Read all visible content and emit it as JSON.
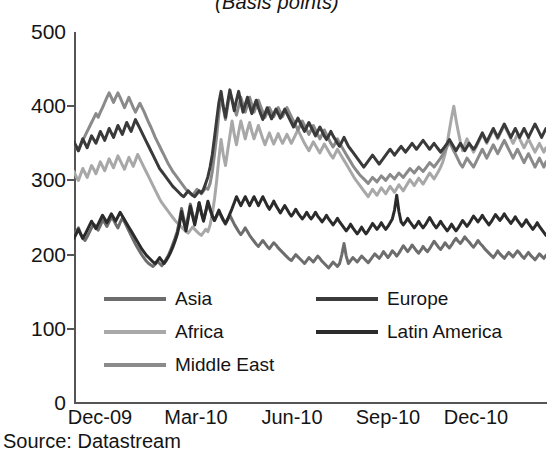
{
  "chart_data": {
    "type": "line",
    "title": "(Basis points)",
    "xlabel": "",
    "ylabel": "",
    "ylim": [
      0,
      500
    ],
    "yticks": [
      0,
      100,
      200,
      300,
      400,
      500
    ],
    "xticks": [
      "Dec-09",
      "Mar-10",
      "Jun-10",
      "Sep-10",
      "Dec-10"
    ],
    "grid": false,
    "legend_position": "inside-lower-left",
    "source": "Source: Datastream",
    "series": [
      {
        "name": "Asia",
        "color": "#6d6d6d",
        "values": [
          227,
          231,
          236,
          228,
          222,
          219,
          224,
          230,
          236,
          241,
          238,
          233,
          239,
          246,
          243,
          238,
          244,
          250,
          247,
          241,
          236,
          243,
          249,
          244,
          238,
          232,
          226,
          220,
          214,
          209,
          204,
          199,
          195,
          191,
          188,
          186,
          184,
          187,
          191,
          188,
          185,
          189,
          194,
          199,
          206,
          214,
          222,
          231,
          245,
          262,
          248,
          236,
          252,
          268,
          255,
          243,
          256,
          270,
          258,
          247,
          258,
          268,
          260,
          252,
          246,
          252,
          258,
          252,
          246,
          241,
          247,
          253,
          247,
          241,
          236,
          231,
          227,
          231,
          236,
          231,
          226,
          222,
          218,
          214,
          211,
          215,
          219,
          215,
          211,
          208,
          212,
          216,
          213,
          209,
          206,
          203,
          200,
          197,
          194,
          192,
          196,
          200,
          197,
          194,
          191,
          188,
          192,
          196,
          193,
          190,
          194,
          198,
          195,
          191,
          188,
          185,
          182,
          186,
          190,
          187,
          184,
          188,
          200,
          215,
          198,
          188,
          192,
          196,
          193,
          190,
          194,
          198,
          195,
          192,
          189,
          193,
          197,
          201,
          198,
          195,
          199,
          204,
          200,
          196,
          200,
          205,
          202,
          198,
          202,
          207,
          212,
          208,
          204,
          208,
          213,
          209,
          205,
          202,
          206,
          211,
          207,
          204,
          208,
          213,
          218,
          214,
          210,
          207,
          211,
          216,
          212,
          209,
          213,
          218,
          222,
          218,
          215,
          219,
          224,
          220,
          217,
          213,
          210,
          214,
          219,
          215,
          212,
          208,
          205,
          202,
          199,
          196,
          200,
          205,
          201,
          198,
          195,
          199,
          203,
          200,
          197,
          201,
          205,
          202,
          198,
          195,
          199,
          203,
          199,
          196,
          193,
          197,
          201,
          198,
          195,
          199
        ]
      },
      {
        "name": "Africa",
        "color": "#a8a8a8",
        "values": [
          312,
          305,
          300,
          308,
          316,
          310,
          304,
          312,
          320,
          315,
          309,
          317,
          325,
          319,
          313,
          321,
          329,
          323,
          317,
          325,
          333,
          327,
          321,
          315,
          323,
          331,
          325,
          319,
          327,
          335,
          329,
          323,
          317,
          311,
          305,
          299,
          293,
          287,
          281,
          275,
          270,
          266,
          262,
          258,
          254,
          250,
          246,
          243,
          240,
          237,
          234,
          231,
          229,
          233,
          237,
          234,
          231,
          228,
          226,
          230,
          234,
          231,
          240,
          255,
          275,
          300,
          330,
          355,
          335,
          320,
          340,
          360,
          380,
          362,
          348,
          365,
          380,
          368,
          356,
          368,
          378,
          366,
          356,
          365,
          374,
          365,
          356,
          348,
          356,
          364,
          356,
          349,
          356,
          363,
          356,
          350,
          356,
          362,
          356,
          350,
          356,
          362,
          368,
          362,
          356,
          350,
          345,
          340,
          346,
          352,
          347,
          342,
          337,
          343,
          349,
          344,
          339,
          334,
          330,
          336,
          342,
          337,
          332,
          327,
          322,
          317,
          312,
          307,
          302,
          298,
          294,
          290,
          286,
          282,
          278,
          283,
          288,
          284,
          280,
          285,
          290,
          286,
          282,
          287,
          292,
          288,
          284,
          289,
          294,
          290,
          286,
          291,
          296,
          301,
          297,
          293,
          298,
          303,
          299,
          295,
          300,
          305,
          310,
          306,
          302,
          307,
          312,
          318,
          325,
          335,
          350,
          368,
          385,
          400,
          382,
          366,
          352,
          340,
          348,
          356,
          350,
          344,
          338,
          344,
          350,
          356,
          362,
          356,
          350,
          356,
          362,
          368,
          362,
          356,
          362,
          368,
          374,
          368,
          362,
          356,
          350,
          356,
          362,
          356,
          350,
          344,
          350,
          356,
          350,
          344,
          338,
          344,
          350,
          344,
          338,
          344
        ]
      },
      {
        "name": "Middle East",
        "color": "#8a8a8a",
        "values": [
          350,
          345,
          340,
          347,
          354,
          360,
          366,
          372,
          378,
          384,
          390,
          385,
          392,
          398,
          405,
          412,
          418,
          412,
          405,
          412,
          418,
          412,
          405,
          398,
          405,
          412,
          405,
          398,
          392,
          398,
          404,
          398,
          392,
          385,
          378,
          372,
          365,
          358,
          352,
          346,
          340,
          334,
          328,
          322,
          317,
          312,
          308,
          304,
          300,
          296,
          292,
          288,
          285,
          282,
          280,
          284,
          288,
          285,
          282,
          286,
          290,
          288,
          296,
          312,
          335,
          360,
          390,
          415,
          398,
          382,
          400,
          418,
          410,
          398,
          388,
          400,
          412,
          402,
          392,
          402,
          412,
          402,
          392,
          400,
          408,
          400,
          392,
          385,
          392,
          398,
          392,
          386,
          392,
          398,
          392,
          386,
          392,
          398,
          392,
          386,
          380,
          374,
          368,
          374,
          380,
          374,
          368,
          362,
          368,
          374,
          368,
          362,
          356,
          362,
          368,
          362,
          356,
          350,
          345,
          350,
          356,
          350,
          345,
          340,
          335,
          330,
          325,
          320,
          316,
          312,
          308,
          305,
          302,
          299,
          296,
          300,
          304,
          301,
          298,
          302,
          306,
          303,
          300,
          304,
          308,
          305,
          302,
          306,
          310,
          307,
          304,
          308,
          312,
          316,
          313,
          310,
          314,
          318,
          315,
          312,
          316,
          320,
          324,
          321,
          318,
          322,
          326,
          330,
          335,
          340,
          346,
          352,
          346,
          340,
          334,
          328,
          322,
          318,
          324,
          330,
          326,
          322,
          318,
          324,
          330,
          336,
          342,
          336,
          330,
          336,
          342,
          348,
          342,
          336,
          342,
          348,
          354,
          348,
          342,
          336,
          330,
          336,
          342,
          336,
          330,
          324,
          330,
          336,
          330,
          324,
          318,
          324,
          330,
          324,
          318,
          325
        ]
      },
      {
        "name": "Europe",
        "color": "#3a3a3a",
        "values": [
          352,
          346,
          340,
          348,
          356,
          350,
          344,
          352,
          360,
          355,
          350,
          358,
          366,
          360,
          354,
          362,
          370,
          364,
          358,
          366,
          374,
          368,
          362,
          370,
          378,
          372,
          366,
          374,
          382,
          376,
          370,
          364,
          358,
          352,
          346,
          340,
          334,
          328,
          322,
          316,
          312,
          308,
          304,
          300,
          296,
          292,
          289,
          286,
          283,
          280,
          278,
          282,
          286,
          283,
          280,
          278,
          282,
          286,
          283,
          288,
          296,
          305,
          318,
          335,
          358,
          382,
          405,
          420,
          400,
          385,
          405,
          422,
          408,
          394,
          408,
          420,
          405,
          392,
          402,
          412,
          400,
          390,
          400,
          408,
          398,
          390,
          382,
          390,
          398,
          390,
          383,
          390,
          396,
          390,
          384,
          390,
          396,
          390,
          384,
          378,
          372,
          378,
          384,
          378,
          372,
          366,
          372,
          378,
          372,
          366,
          360,
          366,
          372,
          366,
          360,
          355,
          360,
          366,
          360,
          355,
          350,
          346,
          352,
          358,
          352,
          346,
          342,
          338,
          334,
          330,
          326,
          322,
          318,
          322,
          326,
          330,
          334,
          330,
          326,
          322,
          326,
          330,
          334,
          338,
          342,
          338,
          334,
          338,
          342,
          346,
          342,
          338,
          342,
          346,
          350,
          346,
          342,
          346,
          350,
          354,
          350,
          346,
          342,
          346,
          350,
          346,
          342,
          338,
          342,
          346,
          350,
          355,
          350,
          345,
          340,
          345,
          350,
          345,
          340,
          345,
          350,
          346,
          342,
          346,
          352,
          358,
          364,
          358,
          352,
          358,
          364,
          370,
          364,
          358,
          364,
          370,
          376,
          370,
          364,
          358,
          364,
          370,
          364,
          358,
          364,
          370,
          364,
          358,
          364,
          370,
          376,
          370,
          364,
          358,
          364,
          370
        ]
      },
      {
        "name": "Latin America",
        "color": "#2b2b2b",
        "values": [
          222,
          228,
          234,
          228,
          222,
          227,
          233,
          239,
          245,
          240,
          235,
          241,
          247,
          253,
          248,
          243,
          249,
          255,
          250,
          245,
          251,
          257,
          252,
          247,
          242,
          237,
          232,
          227,
          222,
          217,
          212,
          207,
          203,
          199,
          196,
          193,
          190,
          188,
          192,
          196,
          192,
          188,
          192,
          197,
          203,
          210,
          218,
          227,
          240,
          258,
          244,
          232,
          248,
          265,
          252,
          240,
          254,
          270,
          256,
          245,
          258,
          272,
          262,
          252,
          246,
          253,
          260,
          253,
          247,
          242,
          248,
          255,
          262,
          270,
          278,
          272,
          266,
          272,
          278,
          272,
          266,
          272,
          278,
          272,
          266,
          272,
          278,
          272,
          266,
          261,
          266,
          272,
          266,
          261,
          256,
          261,
          266,
          261,
          256,
          252,
          256,
          261,
          256,
          252,
          248,
          252,
          257,
          252,
          248,
          252,
          257,
          252,
          248,
          244,
          248,
          253,
          248,
          244,
          240,
          244,
          249,
          244,
          240,
          236,
          232,
          236,
          241,
          236,
          232,
          228,
          232,
          237,
          232,
          228,
          232,
          237,
          242,
          238,
          234,
          238,
          243,
          238,
          234,
          238,
          243,
          248,
          260,
          280,
          258,
          244,
          240,
          244,
          249,
          244,
          240,
          236,
          240,
          245,
          240,
          236,
          240,
          245,
          250,
          245,
          240,
          236,
          240,
          245,
          240,
          236,
          232,
          236,
          241,
          236,
          232,
          236,
          241,
          246,
          242,
          238,
          242,
          247,
          252,
          248,
          244,
          248,
          253,
          248,
          244,
          240,
          244,
          249,
          254,
          250,
          246,
          250,
          255,
          250,
          246,
          242,
          246,
          251,
          246,
          242,
          238,
          242,
          247,
          242,
          238,
          234,
          238,
          243,
          238,
          234,
          230,
          226
        ]
      }
    ]
  },
  "legend": {
    "items": [
      {
        "label": "Asia",
        "color": "#6d6d6d"
      },
      {
        "label": "Africa",
        "color": "#a8a8a8"
      },
      {
        "label": "Middle East",
        "color": "#8a8a8a"
      },
      {
        "label": "Europe",
        "color": "#3a3a3a"
      },
      {
        "label": "Latin America",
        "color": "#2b2b2b"
      }
    ]
  },
  "axes": {
    "y_labels": [
      "500",
      "400",
      "300",
      "200",
      "100",
      "0"
    ],
    "x_labels": [
      "Dec-09",
      "Mar-10",
      "Jun-10",
      "Sep-10",
      "Dec-10"
    ]
  },
  "footer": {
    "source": "Source: Datastream"
  }
}
